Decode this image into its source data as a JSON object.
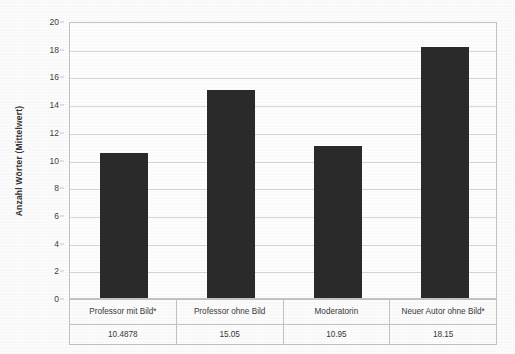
{
  "chart_data": {
    "type": "bar",
    "title": "",
    "xlabel": "",
    "ylabel": "Anzahl Wörter (Mittelwert)",
    "categories": [
      "Professor mit Bild*",
      "Professor ohne Bild",
      "Moderatorin",
      "Neuer Autor ohne Bild*"
    ],
    "values": [
      10.4878,
      15.05,
      10.95,
      18.15
    ],
    "value_labels": [
      "10.4878",
      "15.05",
      "10.95",
      "18.15"
    ],
    "ylim": [
      0,
      20
    ],
    "ytick_labels": [
      "0",
      "2",
      "4",
      "6",
      "8",
      "10",
      "12",
      "14",
      "16",
      "18",
      "20"
    ],
    "ytick_values": [
      0,
      2,
      4,
      6,
      8,
      10,
      12,
      14,
      16,
      18,
      20
    ],
    "grid": "horizontal",
    "legend": "none",
    "bar_color": "#2b2b2b",
    "gridline_color": "#d7d7d7",
    "plot_border_color": "#c4c4c4",
    "background_color": "#ffffff",
    "has_data_table": true
  }
}
